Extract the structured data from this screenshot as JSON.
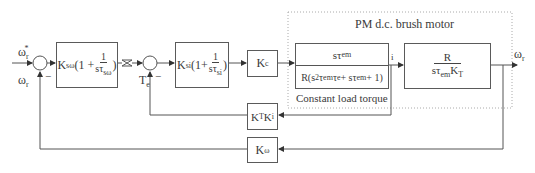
{
  "diagram": {
    "title": "PM d.c. brush motor",
    "subsystem_note": "Constant load torque",
    "inputs": {
      "reference_speed": "ω",
      "reference_speed_sub": "r",
      "reference_speed_sup": "*",
      "feedback_speed": "ω",
      "feedback_speed_sub": "r",
      "torque_feedback": "T",
      "torque_feedback_sub": "e",
      "current_node": "i"
    },
    "output": {
      "label": "ω",
      "sub": "r"
    },
    "signs": {
      "minus1": "−",
      "minus2": "−"
    },
    "blocks": {
      "speed_controller": {
        "k": "K",
        "k_sub": "sω",
        "pre": "(1 + ",
        "num": "1",
        "den": "sτ",
        "den_sub": "sω",
        "post": ")"
      },
      "current_controller": {
        "k": "K",
        "k_sub": "si",
        "pre": "(1+",
        "num": "1",
        "den": "sτ",
        "den_sub": "si",
        "post": ")"
      },
      "converter_gain": {
        "k": "K",
        "k_sub": "c"
      },
      "electrical": {
        "num": "sτ",
        "num_sub": "em",
        "den_a": "R(s",
        "den_sup": "2",
        "den_b": "τ",
        "den_b_sub": "em",
        "den_c": "τ",
        "den_c_sub": "e",
        "den_d": " + sτ",
        "den_d_sub": "em",
        "den_e": " + 1)"
      },
      "mechanical": {
        "num": "R",
        "den_a": "sτ",
        "den_a_sub": "em",
        "den_b": "K",
        "den_b_sub": "T"
      },
      "current_feedback": {
        "a": "K",
        "a_sub": "T",
        "b": "K",
        "b_sub": "i"
      },
      "speed_feedback": {
        "k": "K",
        "k_sub": "ω"
      }
    },
    "colors": {
      "line": "#555555",
      "dotted": "#aaaaaa",
      "text": "#3a3a3a"
    }
  }
}
